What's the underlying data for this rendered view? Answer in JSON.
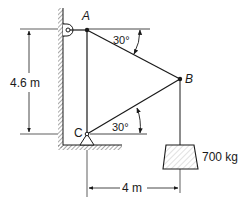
{
  "figure": {
    "type": "statics-truss-diagram",
    "points": {
      "A": {
        "label": "A"
      },
      "B": {
        "label": "B"
      },
      "C": {
        "label": "C"
      }
    },
    "angles": {
      "at_A": "30°",
      "at_C": "30°"
    },
    "dimensions": {
      "vertical": "4.6 m",
      "horizontal": "4 m"
    },
    "load": {
      "label": "700 kg"
    },
    "colors": {
      "ink": "#1a1a1a",
      "hatch": "#555555",
      "background": "#ffffff"
    }
  }
}
